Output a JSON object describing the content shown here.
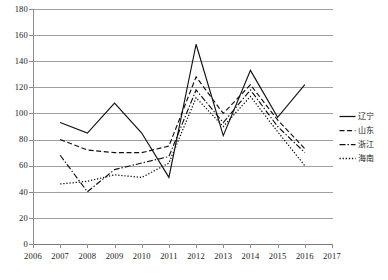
{
  "chart_data": {
    "type": "line",
    "title": "",
    "subtitle": "",
    "xlabel": "",
    "ylabel": "",
    "xlim": [
      2006,
      2017
    ],
    "ylim": [
      0,
      180
    ],
    "ytick_step": 20,
    "grid": true,
    "legend_position": "right",
    "x": [
      2007,
      2008,
      2009,
      2010,
      2011,
      2012,
      2013,
      2014,
      2015,
      2016
    ],
    "xtick_labels": [
      "2006",
      "2007",
      "2008",
      "2009",
      "2010",
      "2011",
      "2012",
      "2013",
      "2014",
      "2015",
      "2016",
      "2017"
    ],
    "ytick_labels": [
      "0",
      "20",
      "40",
      "60",
      "80",
      "100",
      "120",
      "140",
      "160",
      "180"
    ],
    "series": [
      {
        "name": "辽宁",
        "style": "solid",
        "color": "#111111",
        "values": [
          93,
          85,
          108,
          85,
          51,
          153,
          83,
          133,
          97,
          122
        ]
      },
      {
        "name": "山东",
        "style": "dashed",
        "color": "#111111",
        "values": [
          80,
          72,
          70,
          70,
          75,
          128,
          100,
          122,
          95,
          73
        ]
      },
      {
        "name": "浙江",
        "style": "dash-dot",
        "color": "#111111",
        "values": [
          68,
          40,
          57,
          62,
          67,
          118,
          93,
          118,
          90,
          70
        ]
      },
      {
        "name": "海南",
        "style": "dotted",
        "color": "#111111",
        "values": [
          46,
          48,
          53,
          51,
          62,
          112,
          90,
          113,
          86,
          60
        ]
      }
    ]
  },
  "legend": {
    "items": [
      {
        "label": "辽宁",
        "swatch": "solid-line-swatch"
      },
      {
        "label": "山东",
        "swatch": "dashed-line-swatch"
      },
      {
        "label": "浙江",
        "swatch": "dash-dot-line-swatch"
      },
      {
        "label": "海南",
        "swatch": "dotted-line-swatch"
      }
    ]
  }
}
